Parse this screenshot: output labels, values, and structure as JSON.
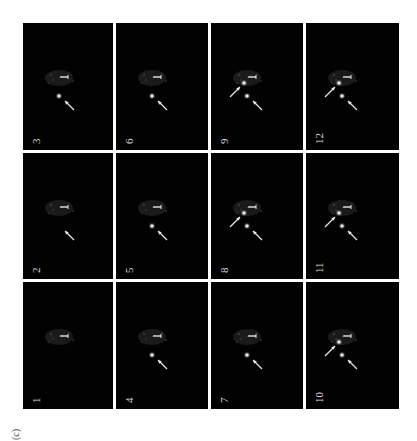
{
  "figure": {
    "label": "(c)",
    "marker_label": "1",
    "colors": {
      "background": "#ffffff",
      "panel": "#020202",
      "signal": "#e6e6e6"
    }
  },
  "panels": [
    {
      "label": "1",
      "dots": 0,
      "arrows": 0
    },
    {
      "label": "2",
      "dots": 0,
      "arrows": 1
    },
    {
      "label": "3",
      "dots": 1,
      "arrows": 1
    },
    {
      "label": "4",
      "dots": 1,
      "arrows": 1
    },
    {
      "label": "5",
      "dots": 1,
      "arrows": 1
    },
    {
      "label": "6",
      "dots": 1,
      "arrows": 1
    },
    {
      "label": "7",
      "dots": 1,
      "arrows": 1
    },
    {
      "label": "8",
      "dots": 2,
      "arrows": 2
    },
    {
      "label": "9",
      "dots": 2,
      "arrows": 2
    },
    {
      "label": "10",
      "dots": 2,
      "arrows": 2
    },
    {
      "label": "11",
      "dots": 2,
      "arrows": 2
    },
    {
      "label": "12",
      "dots": 2,
      "arrows": 2
    }
  ]
}
